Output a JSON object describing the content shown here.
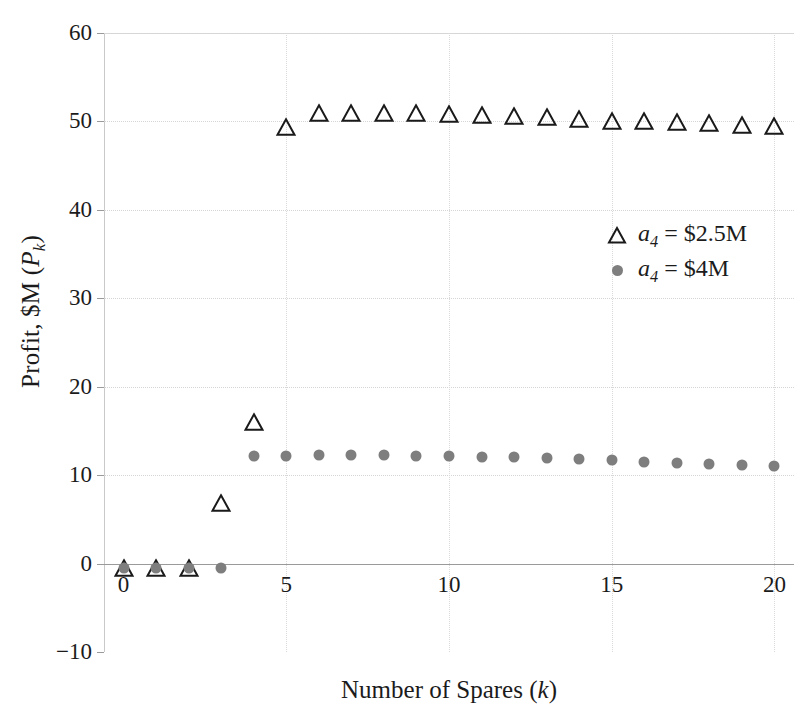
{
  "chart": {
    "type": "scatter",
    "title": "",
    "xlabel_parts": {
      "main": "Number of Spares (",
      "italic": "k",
      "tail": ")"
    },
    "ylabel_parts": {
      "main": "Profit, $M (",
      "italic": "P",
      "sub": "k",
      "tail": ")"
    },
    "xlabel_plain": "Number of Spares (k)",
    "ylabel_plain": "Profit, $M (Pk)",
    "xticks": [
      0,
      5,
      10,
      15,
      20
    ],
    "yticks": [
      -10,
      0,
      10,
      20,
      30,
      40,
      50,
      60
    ],
    "xlim": [
      -0.6,
      20.6
    ],
    "ylim": [
      -10,
      60
    ],
    "grid": true,
    "legend_position": "right-middle",
    "colors": {
      "triangle_stroke": "#1a1a1a",
      "dot_fill": "#7e7e7e",
      "grid": "#d5d5d5",
      "axis": "#9a9a9a",
      "text": "#1b1b1b",
      "background": "#ffffff"
    }
  },
  "legend": {
    "entries": [
      {
        "marker": "open-triangle",
        "label_parts": {
          "italic": "a",
          "sub": "4",
          "tail": " = $2.5M"
        },
        "label_plain": "a4 = $2.5M"
      },
      {
        "marker": "filled-dot",
        "label_parts": {
          "italic": "a",
          "sub": "4",
          "tail": " = $4M"
        },
        "label_plain": "a4 = $4M"
      }
    ]
  },
  "chart_data": {
    "type": "scatter",
    "title": "",
    "xlabel": "Number of Spares (k)",
    "ylabel": "Profit, $M (P_k)",
    "xlim": [
      -0.6,
      20.6
    ],
    "ylim": [
      -10,
      60
    ],
    "xticks": [
      0,
      5,
      10,
      15,
      20
    ],
    "yticks": [
      -10,
      0,
      10,
      20,
      30,
      40,
      50,
      60
    ],
    "grid": true,
    "legend_position": "right-middle",
    "x": [
      0,
      1,
      2,
      3,
      4,
      5,
      6,
      7,
      8,
      9,
      10,
      11,
      12,
      13,
      14,
      15,
      16,
      17,
      18,
      19,
      20
    ],
    "series": [
      {
        "name": "a_4 = $2.5M",
        "marker": "open-triangle",
        "color": "#1a1a1a",
        "values": [
          -0.5,
          -0.5,
          -0.5,
          6.8,
          16.0,
          49.4,
          50.9,
          51.0,
          50.9,
          50.9,
          50.8,
          50.7,
          50.6,
          50.5,
          50.3,
          50.1,
          50.0,
          49.9,
          49.8,
          49.6,
          49.5
        ]
      },
      {
        "name": "a_4 = $4M",
        "marker": "filled-dot",
        "color": "#7e7e7e",
        "values": [
          -0.5,
          -0.5,
          -0.5,
          -0.5,
          12.2,
          12.2,
          12.3,
          12.3,
          12.3,
          12.2,
          12.2,
          12.1,
          12.0,
          11.9,
          11.8,
          11.7,
          11.5,
          11.4,
          11.3,
          11.2,
          11.0
        ]
      }
    ]
  }
}
